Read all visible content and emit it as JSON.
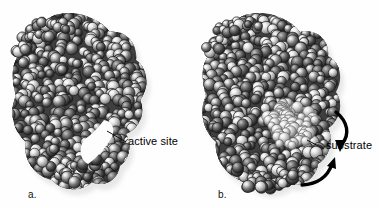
{
  "figure": {
    "background_color": "#fefefe",
    "molecule_color": "#4a4a4a",
    "substrate_color": "#b9b9b9",
    "outline_color": "#1a1a1a",
    "highlight_color": "#f2f2f2",
    "text_color": "#000000"
  },
  "panels": [
    {
      "id": "a",
      "label": "a.",
      "caption": "free enzyme with open active site cleft",
      "callout": {
        "text": "active site",
        "leader": "diagonal line from cleft up-right to label"
      },
      "arrows": []
    },
    {
      "id": "b",
      "label": "b.",
      "caption": "enzyme with substrate bound in active site",
      "callout": {
        "text": "substrate",
        "leader": "short diagonal line from substrate cluster to label"
      },
      "arrows": [
        {
          "name": "arrow-upper-curved",
          "direction": "clockwise-down",
          "color": "#000000"
        },
        {
          "name": "arrow-lower-curved",
          "direction": "counterclockwise-up",
          "color": "#000000"
        }
      ]
    }
  ],
  "icons": {
    "molecule": "space-filling-atom-cluster-icon",
    "substrate": "substrate-cluster-icon",
    "arrow_upper": "curved-arrow-down-icon",
    "arrow_lower": "curved-arrow-up-icon",
    "leader_line": "callout-leader-line-icon"
  }
}
